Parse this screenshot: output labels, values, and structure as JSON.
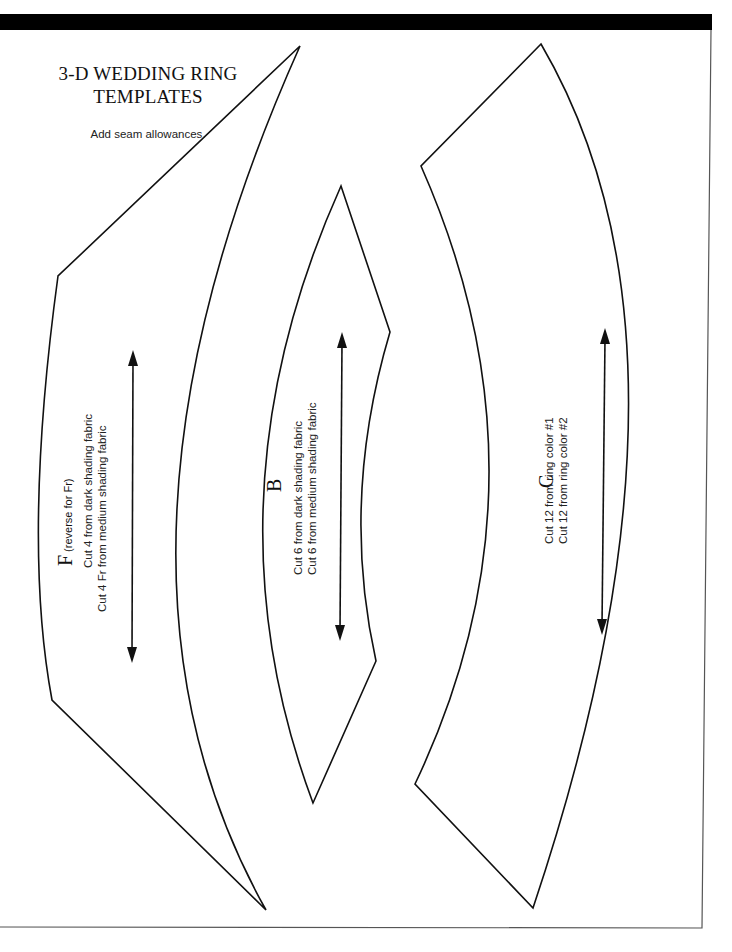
{
  "header": {
    "title_line1": "3-D WEDDING RING",
    "title_line2": "TEMPLATES",
    "subtitle": "Add seam allowances."
  },
  "templates": [
    {
      "id": "F",
      "letter": "F",
      "note": "(reverse for Fr)",
      "cut_lines": [
        "Cut 4 from dark shading fabric",
        "Cut 4 Fr from medium shading fabric"
      ]
    },
    {
      "id": "B",
      "letter": "B",
      "note": "",
      "cut_lines": [
        "Cut 6 from dark shading fabric",
        "Cut 6 from medium shading fabric"
      ]
    },
    {
      "id": "C",
      "letter": "C",
      "note": "",
      "cut_lines": [
        "Cut 12 from ring color #1",
        "Cut 12 from ring color #2"
      ]
    }
  ],
  "colors": {
    "ink": "#111111",
    "paper": "#ffffff",
    "bar": "#000000"
  }
}
